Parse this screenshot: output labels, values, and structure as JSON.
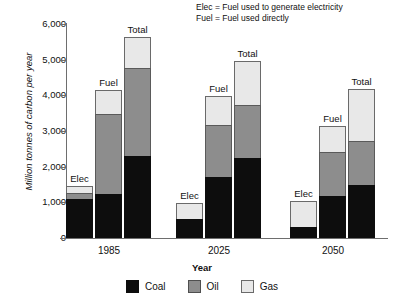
{
  "annotation": {
    "line1": "Elec = Fuel used to generate electricity",
    "line2": "Fuel = Fuel used directly"
  },
  "chart_data": {
    "type": "bar",
    "stacked": true,
    "title": "",
    "xlabel": "Year",
    "ylabel": "Million tonnes of carbon per year",
    "ylim": [
      0,
      6000
    ],
    "ytick_labels": [
      "0",
      "1,000",
      "2,000",
      "3,000",
      "4,000",
      "5,000",
      "6,000"
    ],
    "yticks": [
      0,
      1000,
      2000,
      3000,
      4000,
      5000,
      6000
    ],
    "grid": false,
    "legend_position": "bottom",
    "categories": [
      "1985",
      "2025",
      "2050"
    ],
    "subcategories": [
      "Elec",
      "Fuel",
      "Total"
    ],
    "series": [
      {
        "name": "Coal",
        "color": "#0d0d0d",
        "values": {
          "1985": {
            "Elec": 1080,
            "Fuel": 1230,
            "Total": 2290
          },
          "2025": {
            "Elec": 530,
            "Fuel": 1700,
            "Total": 2250
          },
          "2050": {
            "Elec": 310,
            "Fuel": 1170,
            "Total": 1480
          }
        }
      },
      {
        "name": "Oil",
        "color": "#8d8d8d",
        "values": {
          "1985": {
            "Elec": 180,
            "Fuel": 2250,
            "Total": 2490
          },
          "2025": {
            "Elec": 0,
            "Fuel": 1480,
            "Total": 1480
          },
          "2050": {
            "Elec": 0,
            "Fuel": 1230,
            "Total": 1240
          }
        }
      },
      {
        "name": "Gas",
        "color": "#e8e8e8",
        "values": {
          "1985": {
            "Elec": 190,
            "Fuel": 680,
            "Total": 850
          },
          "2025": {
            "Elec": 450,
            "Fuel": 800,
            "Total": 1220
          },
          "2050": {
            "Elec": 720,
            "Fuel": 740,
            "Total": 1450
          }
        }
      }
    ],
    "totals": {
      "1985": {
        "Elec": 1450,
        "Fuel": 4160,
        "Total": 5630
      },
      "2025": {
        "Elec": 980,
        "Fuel": 3980,
        "Total": 4950
      },
      "2050": {
        "Elec": 1030,
        "Fuel": 3140,
        "Total": 4170
      }
    }
  },
  "legend": {
    "items": [
      {
        "label": "Coal",
        "color": "#0d0d0d"
      },
      {
        "label": "Oil",
        "color": "#8d8d8d"
      },
      {
        "label": "Gas",
        "color": "#e8e8e8"
      }
    ]
  }
}
